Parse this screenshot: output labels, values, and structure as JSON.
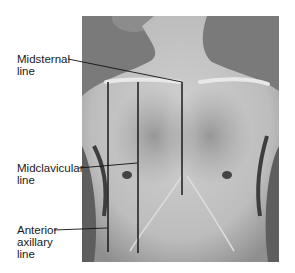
{
  "figure": {
    "background_color": "#7a7a7a",
    "skin_color": "#c8c8c8",
    "line_color": "#111111",
    "labels": [
      {
        "id": "midsternal",
        "text": "Midsternal\nline"
      },
      {
        "id": "midclavicular",
        "text": "Midclavicular\nline"
      },
      {
        "id": "anterior-axillary",
        "text": "Anterior\naxillary\nline"
      }
    ],
    "reference_lines": [
      {
        "name": "midsternal-line",
        "x": 182,
        "y1": 82,
        "y2": 195
      },
      {
        "name": "midclavicular-line",
        "x": 138,
        "y1": 82,
        "y2": 253
      },
      {
        "name": "anterior-axillary-line",
        "x": 108,
        "y1": 82,
        "y2": 252
      }
    ]
  }
}
